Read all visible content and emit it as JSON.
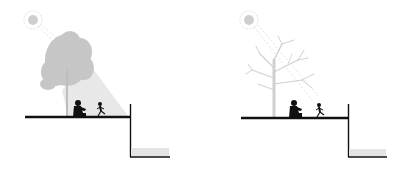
{
  "diagram": {
    "panels": [
      {
        "id": "summer",
        "tree": "leafy-tree",
        "light": "shade-cone",
        "figures": [
          "seated-adult",
          "running-child"
        ]
      },
      {
        "id": "winter",
        "tree": "bare-tree",
        "light": "direct-sun-rays",
        "figures": [
          "seated-adult",
          "running-child"
        ]
      }
    ],
    "colors": {
      "ground": "#111111",
      "tree_leafy": "#c8c8c8",
      "tree_bare": "#d2d2d2",
      "sun": "#cfcfcf",
      "shade_cone": "#e6e6e6",
      "water": "#e4e4e4",
      "figure": "#111111"
    }
  }
}
